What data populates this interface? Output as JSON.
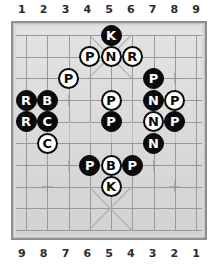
{
  "board": {
    "columns_top": [
      "1",
      "2",
      "3",
      "4",
      "5",
      "6",
      "7",
      "8",
      "9"
    ],
    "columns_bottom": [
      "9",
      "8",
      "7",
      "6",
      "5",
      "4",
      "3",
      "2",
      "1"
    ],
    "cols": 9,
    "rows": 10,
    "background_color": "#d9d9d9",
    "line_color": "#9a9a9a",
    "border_color": "#8f8f8f",
    "black_piece_color": "#0b0b0b",
    "white_piece_color": "#ffffff"
  },
  "pieces": [
    {
      "label": "K",
      "color": "black",
      "col": 5,
      "row": 1
    },
    {
      "label": "P",
      "color": "white",
      "col": 4,
      "row": 2
    },
    {
      "label": "N",
      "color": "white",
      "col": 5,
      "row": 2
    },
    {
      "label": "R",
      "color": "white",
      "col": 6,
      "row": 2
    },
    {
      "label": "P",
      "color": "white",
      "col": 3,
      "row": 3
    },
    {
      "label": "P",
      "color": "black",
      "col": 7,
      "row": 3
    },
    {
      "label": "R",
      "color": "black",
      "col": 1,
      "row": 4
    },
    {
      "label": "B",
      "color": "black",
      "col": 2,
      "row": 4
    },
    {
      "label": "P",
      "color": "white",
      "col": 5,
      "row": 4
    },
    {
      "label": "N",
      "color": "black",
      "col": 7,
      "row": 4
    },
    {
      "label": "P",
      "color": "white",
      "col": 8,
      "row": 4
    },
    {
      "label": "R",
      "color": "black",
      "col": 1,
      "row": 5
    },
    {
      "label": "C",
      "color": "black",
      "col": 2,
      "row": 5
    },
    {
      "label": "P",
      "color": "black",
      "col": 5,
      "row": 5
    },
    {
      "label": "N",
      "color": "white",
      "col": 7,
      "row": 5
    },
    {
      "label": "P",
      "color": "black",
      "col": 8,
      "row": 5
    },
    {
      "label": "C",
      "color": "white",
      "col": 2,
      "row": 6
    },
    {
      "label": "N",
      "color": "black",
      "col": 7,
      "row": 6
    },
    {
      "label": "P",
      "color": "black",
      "col": 4,
      "row": 7
    },
    {
      "label": "B",
      "color": "white",
      "col": 5,
      "row": 7
    },
    {
      "label": "P",
      "color": "black",
      "col": 6,
      "row": 7
    },
    {
      "label": "K",
      "color": "white",
      "col": 5,
      "row": 8
    }
  ]
}
